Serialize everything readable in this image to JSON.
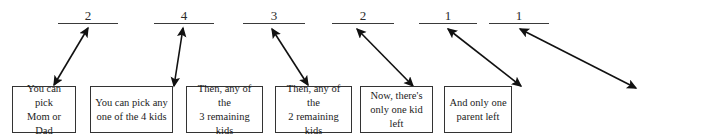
{
  "diagram": {
    "ink_color": "#2b2b2b",
    "box_border_color": "#333333",
    "slots": [
      {
        "id": "slot-1",
        "value": "2",
        "x": 58,
        "y": 8,
        "width": 60,
        "height": 16
      },
      {
        "id": "slot-2",
        "value": "4",
        "x": 154,
        "y": 8,
        "width": 60,
        "height": 16
      },
      {
        "id": "slot-3",
        "value": "3",
        "x": 243,
        "y": 8,
        "width": 62,
        "height": 16
      },
      {
        "id": "slot-4",
        "value": "2",
        "x": 332,
        "y": 8,
        "width": 62,
        "height": 16
      },
      {
        "id": "slot-5",
        "value": "1",
        "x": 419,
        "y": 8,
        "width": 58,
        "height": 16
      },
      {
        "id": "slot-6",
        "value": "1",
        "x": 489,
        "y": 8,
        "width": 60,
        "height": 16
      }
    ],
    "boxes": [
      {
        "id": "box-1",
        "text": "You can pick\nMom or Dad",
        "x": 12,
        "y": 86,
        "width": 64,
        "height": 47
      },
      {
        "id": "box-2",
        "text": "You can pick any\none of the 4 kids",
        "x": 90,
        "y": 86,
        "width": 83,
        "height": 47
      },
      {
        "id": "box-3",
        "text": "Then, any of the\n3 remaining kids",
        "x": 186,
        "y": 86,
        "width": 77,
        "height": 47
      },
      {
        "id": "box-4",
        "text": "Then, any of the\n2 remaining kids",
        "x": 275,
        "y": 86,
        "width": 77,
        "height": 47
      },
      {
        "id": "box-5",
        "text": "Now, there's\nonly one kid left",
        "x": 360,
        "y": 86,
        "width": 73,
        "height": 47
      },
      {
        "id": "box-6",
        "text": "And only one\nparent left",
        "x": 444,
        "y": 86,
        "width": 68,
        "height": 47
      }
    ],
    "arrows": [
      {
        "id": "arrow-1",
        "from_box": "box-1",
        "to_slot": "slot-1",
        "x1": 54,
        "y1": 85,
        "x2": 88,
        "y2": 28,
        "double_headed": true
      },
      {
        "id": "arrow-2",
        "from_box": "box-2",
        "to_slot": "slot-2",
        "x1": 174,
        "y1": 86,
        "x2": 183,
        "y2": 28,
        "double_headed": true
      },
      {
        "id": "arrow-3",
        "from_box": "box-3",
        "to_slot": "slot-3",
        "x1": 308,
        "y1": 85,
        "x2": 272,
        "y2": 29,
        "double_headed": true
      },
      {
        "id": "arrow-4",
        "from_box": "box-4",
        "to_slot": "slot-4",
        "x1": 413,
        "y1": 86,
        "x2": 357,
        "y2": 29,
        "double_headed": true
      },
      {
        "id": "arrow-5",
        "from_box": "box-5",
        "to_slot": "slot-5",
        "x1": 521,
        "y1": 86,
        "x2": 448,
        "y2": 29,
        "double_headed": true
      },
      {
        "id": "arrow-6",
        "from_box": "box-6",
        "to_slot": "slot-6",
        "x1": 636,
        "y1": 88,
        "x2": 520,
        "y2": 29,
        "double_headed": true
      }
    ]
  }
}
